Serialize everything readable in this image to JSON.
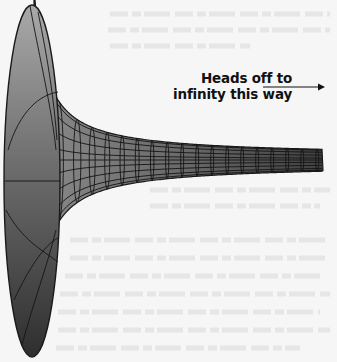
{
  "figure": {
    "annotation": {
      "line1": "Heads off to",
      "line2": "infinity this way",
      "arrow_direction": "right"
    },
    "colors": {
      "paper": "#f6f6f6",
      "outline": "#1a1a1a",
      "horn_light": "#a8a8a8",
      "horn_mid": "#7a7a7a",
      "horn_dark": "#3a3a3a",
      "bleed_through": "#e6e6e6"
    }
  }
}
